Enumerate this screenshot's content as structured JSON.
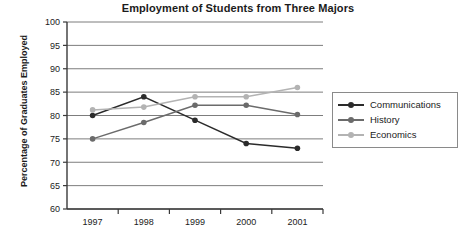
{
  "chart_data": {
    "type": "line",
    "title": "Employment of Students from Three Majors",
    "xlabel": "",
    "ylabel": "Percentage of Graduates Employed",
    "categories": [
      "1997",
      "1998",
      "1999",
      "2000",
      "2001"
    ],
    "ylim": [
      60,
      100
    ],
    "yticks": [
      60,
      65,
      70,
      75,
      80,
      85,
      90,
      95,
      100
    ],
    "ytick_labels": [
      "60",
      "65",
      "70",
      "75",
      "80",
      "85",
      "90",
      "95",
      "100"
    ],
    "grid": true,
    "legend_position": "right",
    "series": [
      {
        "name": "Communications",
        "color": "#2b2b2b",
        "values": [
          80,
          84,
          79,
          74,
          73
        ]
      },
      {
        "name": "History",
        "color": "#6b6b6b",
        "values": [
          75,
          78.5,
          82.2,
          82.2,
          80.2
        ]
      },
      {
        "name": "Economics",
        "color": "#b3b3b3",
        "values": [
          81.2,
          81.8,
          84,
          84,
          86
        ]
      }
    ]
  },
  "legend": {
    "items": [
      {
        "label": "Communications",
        "color": "#2b2b2b"
      },
      {
        "label": "History",
        "color": "#6b6b6b"
      },
      {
        "label": "Economics",
        "color": "#b3b3b3"
      }
    ]
  },
  "axis": {
    "x_labels": [
      "1997",
      "1998",
      "1999",
      "2000",
      "2001"
    ],
    "y_labels": [
      "100",
      "95",
      "90",
      "85",
      "80",
      "75",
      "70",
      "65",
      "60"
    ]
  }
}
